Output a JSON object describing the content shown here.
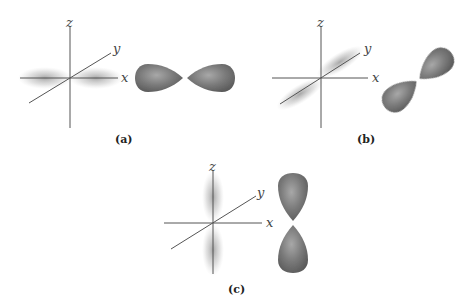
{
  "figure": {
    "panels": [
      {
        "id": "a",
        "caption": "(a)",
        "orbital": "p_x",
        "axis_labels": {
          "x": "x",
          "y": "y",
          "z": "z"
        }
      },
      {
        "id": "b",
        "caption": "(b)",
        "orbital": "p_y",
        "axis_labels": {
          "x": "x",
          "y": "y",
          "z": "z"
        }
      },
      {
        "id": "c",
        "caption": "(c)",
        "orbital": "p_z",
        "axis_labels": {
          "x": "x",
          "y": "y",
          "z": "z"
        }
      }
    ],
    "colors": {
      "lobe": "#6e6e6e",
      "lobe_highlight": "#b0b0b0",
      "cloud": "#9a9a9a",
      "axis": "#555555"
    }
  }
}
